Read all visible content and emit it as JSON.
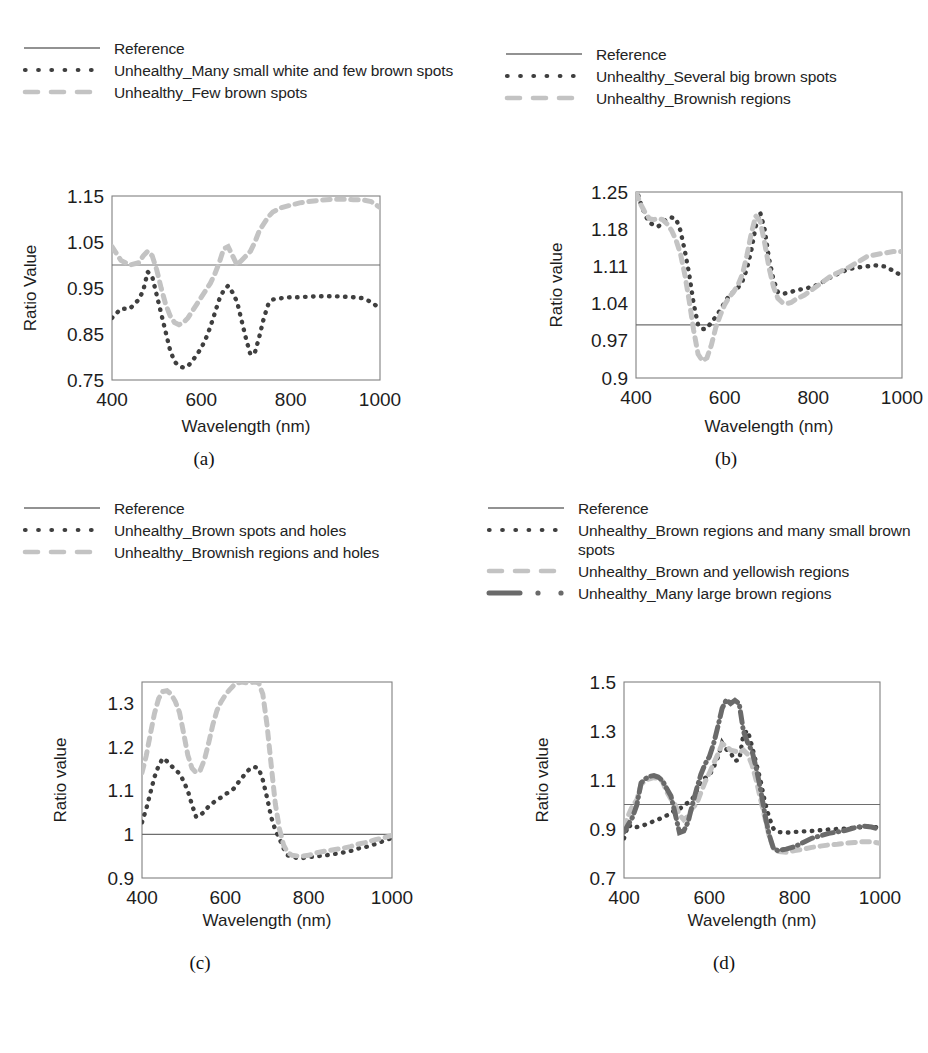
{
  "figure": {
    "panel_count": 4,
    "styles": {
      "reference_color": "#6e6e6e",
      "dotted_color": "#3f3f3f",
      "dashed_color": "#c3c3c3",
      "dashdot_color": "#6a6a6a",
      "frame_color": "#808080",
      "background": "#ffffff"
    }
  },
  "panels": [
    {
      "caption": "(a)",
      "legend": [
        {
          "label": "Reference",
          "style": "solid-line",
          "color": "#6e6e6e"
        },
        {
          "label": "Unhealthy_Many small white and few brown spots",
          "style": "dotted",
          "color": "#3f3f3f"
        },
        {
          "label": "Unhealthy_Few brown spots",
          "style": "dashed",
          "color": "#c3c3c3"
        }
      ],
      "chart_data": {
        "type": "line",
        "title": "",
        "xlabel": "Wavelength (nm)",
        "ylabel": "Ratio Value",
        "xlim": [
          400,
          1000
        ],
        "ylim": [
          0.75,
          1.15
        ],
        "xticks": [
          400,
          600,
          800,
          1000
        ],
        "yticks": [
          0.75,
          0.85,
          0.95,
          1.05,
          1.15
        ],
        "grid": false,
        "legend_position": "above",
        "reference_value": 1.0,
        "x": [
          400,
          420,
          440,
          460,
          470,
          480,
          490,
          500,
          510,
          520,
          530,
          540,
          550,
          560,
          570,
          580,
          590,
          600,
          610,
          620,
          630,
          640,
          650,
          660,
          670,
          680,
          690,
          700,
          710,
          720,
          730,
          740,
          750,
          760,
          780,
          800,
          820,
          840,
          860,
          880,
          900,
          920,
          940,
          960,
          980,
          1000
        ],
        "series": [
          {
            "name": "Unhealthy_Many small white and few brown spots",
            "style": "dotted",
            "color": "#3f3f3f",
            "values": [
              0.885,
              0.905,
              0.905,
              0.925,
              0.945,
              0.985,
              0.975,
              0.935,
              0.895,
              0.855,
              0.815,
              0.79,
              0.78,
              0.777,
              0.78,
              0.792,
              0.805,
              0.82,
              0.84,
              0.865,
              0.895,
              0.925,
              0.945,
              0.955,
              0.94,
              0.92,
              0.88,
              0.84,
              0.805,
              0.81,
              0.845,
              0.885,
              0.915,
              0.925,
              0.928,
              0.93,
              0.93,
              0.931,
              0.932,
              0.932,
              0.932,
              0.931,
              0.93,
              0.928,
              0.92,
              0.905
            ]
          },
          {
            "name": "Unhealthy_Few brown spots",
            "style": "dashed",
            "color": "#c3c3c3",
            "values": [
              1.04,
              1.01,
              1.0,
              1.005,
              1.02,
              1.03,
              1.02,
              0.99,
              0.95,
              0.915,
              0.89,
              0.875,
              0.87,
              0.875,
              0.885,
              0.9,
              0.915,
              0.93,
              0.945,
              0.96,
              0.98,
              1.005,
              1.035,
              1.04,
              1.02,
              1.0,
              1.01,
              1.02,
              1.03,
              1.05,
              1.075,
              1.09,
              1.105,
              1.115,
              1.125,
              1.13,
              1.135,
              1.138,
              1.14,
              1.142,
              1.143,
              1.143,
              1.142,
              1.142,
              1.138,
              1.125
            ]
          }
        ]
      }
    },
    {
      "caption": "(b)",
      "legend": [
        {
          "label": "Reference",
          "style": "solid-line",
          "color": "#6e6e6e"
        },
        {
          "label": "Unhealthy_Several big brown spots",
          "style": "dotted",
          "color": "#3f3f3f"
        },
        {
          "label": "Unhealthy_Brownish regions",
          "style": "dashed",
          "color": "#c3c3c3"
        }
      ],
      "chart_data": {
        "type": "line",
        "title": "",
        "xlabel": "Wavelength (nm)",
        "ylabel": "Ratio value",
        "xlim": [
          400,
          1000
        ],
        "ylim": [
          0.9,
          1.25
        ],
        "xticks": [
          400,
          600,
          800,
          1000
        ],
        "yticks": [
          0.9,
          0.97,
          1.04,
          1.11,
          1.18,
          1.25
        ],
        "grid": false,
        "legend_position": "above",
        "reference_value": 1.0,
        "x": [
          400,
          410,
          420,
          430,
          440,
          450,
          460,
          470,
          480,
          490,
          500,
          510,
          520,
          530,
          540,
          550,
          560,
          570,
          580,
          590,
          600,
          610,
          620,
          630,
          640,
          650,
          660,
          670,
          680,
          690,
          700,
          710,
          720,
          730,
          740,
          750,
          760,
          780,
          800,
          820,
          840,
          860,
          880,
          900,
          920,
          940,
          960,
          980,
          1000
        ],
        "series": [
          {
            "name": "Unhealthy_Several big brown spots",
            "style": "dotted",
            "color": "#3f3f3f",
            "values": [
              1.258,
              1.23,
              1.208,
              1.192,
              1.188,
              1.185,
              1.192,
              1.2,
              1.202,
              1.2,
              1.178,
              1.14,
              1.095,
              1.04,
              1.0,
              0.992,
              0.993,
              1.005,
              1.015,
              1.028,
              1.042,
              1.055,
              1.062,
              1.07,
              1.082,
              1.105,
              1.14,
              1.185,
              1.212,
              1.18,
              1.125,
              1.085,
              1.062,
              1.058,
              1.06,
              1.062,
              1.065,
              1.068,
              1.072,
              1.08,
              1.09,
              1.098,
              1.105,
              1.108,
              1.11,
              1.112,
              1.11,
              1.102,
              1.092
            ]
          },
          {
            "name": "Unhealthy_Brownish regions",
            "style": "dashed",
            "color": "#c3c3c3",
            "values": [
              1.25,
              1.228,
              1.212,
              1.2,
              1.198,
              1.2,
              1.198,
              1.19,
              1.178,
              1.16,
              1.135,
              1.095,
              1.045,
              0.99,
              0.945,
              0.932,
              0.938,
              0.962,
              0.995,
              1.018,
              1.038,
              1.052,
              1.062,
              1.075,
              1.095,
              1.13,
              1.172,
              1.205,
              1.195,
              1.155,
              1.108,
              1.072,
              1.05,
              1.042,
              1.04,
              1.042,
              1.048,
              1.056,
              1.068,
              1.08,
              1.092,
              1.1,
              1.108,
              1.118,
              1.128,
              1.132,
              1.135,
              1.138,
              1.138
            ]
          }
        ]
      }
    },
    {
      "caption": "(c)",
      "legend": [
        {
          "label": "Reference",
          "style": "solid-line",
          "color": "#6e6e6e"
        },
        {
          "label": "Unhealthy_Brown spots and holes",
          "style": "dotted",
          "color": "#3f3f3f"
        },
        {
          "label": "Unhealthy_Brownish regions and holes",
          "style": "dashed",
          "color": "#c3c3c3"
        }
      ],
      "chart_data": {
        "type": "line",
        "title": "",
        "xlabel": "Wavelength (nm)",
        "ylabel": "Ratio value",
        "xlim": [
          400,
          1000
        ],
        "ylim": [
          0.9,
          1.35
        ],
        "xticks": [
          400,
          600,
          800,
          1000
        ],
        "yticks": [
          0.9,
          1.0,
          1.1,
          1.2,
          1.3
        ],
        "grid": false,
        "legend_position": "above",
        "reference_value": 1.0,
        "x": [
          400,
          410,
          420,
          430,
          440,
          450,
          460,
          470,
          480,
          490,
          500,
          510,
          520,
          530,
          540,
          550,
          560,
          570,
          580,
          590,
          600,
          610,
          620,
          630,
          640,
          650,
          660,
          670,
          680,
          690,
          700,
          710,
          720,
          730,
          740,
          750,
          760,
          780,
          800,
          820,
          840,
          860,
          880,
          900,
          920,
          940,
          960,
          980,
          1000
        ],
        "series": [
          {
            "name": "Unhealthy_Brown spots and holes",
            "style": "dotted",
            "color": "#3f3f3f",
            "values": [
              1.028,
              1.058,
              1.095,
              1.132,
              1.158,
              1.175,
              1.168,
              1.158,
              1.148,
              1.14,
              1.122,
              1.1,
              1.068,
              1.04,
              1.045,
              1.052,
              1.065,
              1.072,
              1.08,
              1.085,
              1.092,
              1.098,
              1.105,
              1.118,
              1.13,
              1.142,
              1.152,
              1.155,
              1.152,
              1.125,
              1.085,
              1.04,
              1.01,
              0.99,
              0.968,
              0.952,
              0.948,
              0.945,
              0.948,
              0.95,
              0.952,
              0.955,
              0.958,
              0.962,
              0.968,
              0.972,
              0.978,
              0.985,
              0.992
            ]
          },
          {
            "name": "Unhealthy_Brownish regions and holes",
            "style": "dashed",
            "color": "#c3c3c3",
            "values": [
              1.142,
              1.18,
              1.23,
              1.278,
              1.312,
              1.328,
              1.33,
              1.322,
              1.305,
              1.28,
              1.232,
              1.182,
              1.152,
              1.142,
              1.148,
              1.172,
              1.21,
              1.252,
              1.285,
              1.305,
              1.32,
              1.332,
              1.342,
              1.348,
              1.35,
              1.348,
              1.348,
              1.35,
              1.348,
              1.322,
              1.252,
              1.16,
              1.07,
              1.012,
              0.975,
              0.958,
              0.952,
              0.95,
              0.952,
              0.958,
              0.962,
              0.965,
              0.968,
              0.972,
              0.978,
              0.982,
              0.988,
              0.992,
              0.998
            ]
          }
        ]
      }
    },
    {
      "caption": "(d)",
      "legend": [
        {
          "label": "Reference",
          "style": "solid-line",
          "color": "#6e6e6e"
        },
        {
          "label": "Unhealthy_Brown regions and many small brown spots",
          "style": "dotted",
          "color": "#3f3f3f"
        },
        {
          "label": "Unhealthy_Brown and yellowish regions",
          "style": "dashed",
          "color": "#c3c3c3"
        },
        {
          "label": "Unhealthy_Many large brown regions",
          "style": "dash-dot",
          "color": "#6a6a6a"
        }
      ],
      "chart_data": {
        "type": "line",
        "title": "",
        "xlabel": "Wavelength (nm)",
        "ylabel": "Ratio value",
        "xlim": [
          400,
          1000
        ],
        "ylim": [
          0.7,
          1.5
        ],
        "xticks": [
          400,
          600,
          800,
          1000
        ],
        "yticks": [
          0.7,
          0.9,
          1.1,
          1.3,
          1.5
        ],
        "grid": false,
        "legend_position": "above",
        "reference_value": 1.0,
        "x": [
          400,
          410,
          420,
          430,
          440,
          450,
          460,
          470,
          480,
          490,
          500,
          510,
          520,
          530,
          540,
          550,
          560,
          570,
          580,
          590,
          600,
          610,
          620,
          630,
          640,
          650,
          660,
          670,
          680,
          690,
          700,
          710,
          720,
          730,
          740,
          750,
          760,
          780,
          800,
          820,
          840,
          860,
          880,
          900,
          920,
          940,
          960,
          980,
          1000
        ],
        "series": [
          {
            "name": "Unhealthy_Brown regions and many small brown spots",
            "style": "dotted",
            "color": "#3f3f3f",
            "values": [
              0.862,
              0.918,
              0.905,
              0.908,
              0.912,
              0.918,
              0.925,
              0.932,
              0.938,
              0.948,
              0.955,
              0.965,
              0.978,
              0.982,
              0.995,
              1.008,
              1.022,
              1.055,
              1.092,
              1.108,
              1.118,
              1.152,
              1.192,
              1.252,
              1.225,
              1.212,
              1.178,
              1.182,
              1.288,
              1.302,
              1.238,
              1.168,
              1.098,
              1.012,
              0.948,
              0.902,
              0.888,
              0.885,
              0.888,
              0.89,
              0.892,
              0.895,
              0.898,
              0.9,
              0.902,
              0.905,
              0.908,
              0.91,
              0.905
            ]
          },
          {
            "name": "Unhealthy_Brown and yellowish regions",
            "style": "dashed",
            "color": "#c3c3c3",
            "values": [
              0.905,
              0.955,
              0.995,
              1.018,
              1.082,
              1.098,
              1.105,
              1.11,
              1.105,
              1.095,
              1.052,
              1.022,
              0.998,
              0.958,
              0.938,
              0.952,
              0.985,
              1.002,
              1.048,
              1.092,
              1.128,
              1.168,
              1.205,
              1.248,
              1.238,
              1.222,
              1.218,
              1.212,
              1.222,
              1.205,
              1.162,
              1.098,
              1.022,
              0.948,
              0.872,
              0.822,
              0.808,
              0.805,
              0.812,
              0.818,
              0.825,
              0.83,
              0.835,
              0.838,
              0.842,
              0.845,
              0.848,
              0.848,
              0.842
            ]
          },
          {
            "name": "Unhealthy_Many large brown regions",
            "style": "dash-dot",
            "color": "#6a6a6a",
            "values": [
              0.888,
              0.918,
              0.948,
              0.998,
              1.088,
              1.105,
              1.115,
              1.118,
              1.112,
              1.098,
              1.065,
              1.035,
              0.962,
              0.885,
              0.892,
              0.928,
              0.998,
              1.062,
              1.122,
              1.165,
              1.195,
              1.248,
              1.318,
              1.392,
              1.428,
              1.412,
              1.425,
              1.412,
              1.298,
              1.252,
              1.218,
              1.148,
              1.062,
              0.962,
              0.878,
              0.822,
              0.812,
              0.818,
              0.828,
              0.845,
              0.862,
              0.872,
              0.882,
              0.888,
              0.895,
              0.905,
              0.912,
              0.908,
              0.898
            ]
          }
        ]
      }
    }
  ]
}
